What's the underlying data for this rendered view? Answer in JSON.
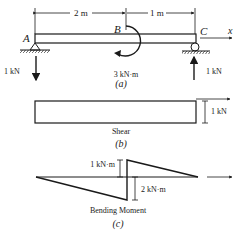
{
  "figure_a": {
    "dim_left": "2 m",
    "dim_right": "1 m",
    "point_a": "A",
    "point_b": "B",
    "point_c": "C",
    "axis_x": "x",
    "reaction_left": "1 kN",
    "reaction_right": "1 kN",
    "moment_label": "3 kN·m",
    "caption": "(a)"
  },
  "figure_b": {
    "value_label": "1 kN",
    "title": "Shear",
    "caption": "(b)"
  },
  "figure_c": {
    "positive_label": "1 kN·m",
    "negative_label": "2 kN·m",
    "title": "Bending Moment",
    "caption": "(c)"
  },
  "colors": {
    "ink": "#1a1a1a",
    "background": "#ffffff"
  }
}
